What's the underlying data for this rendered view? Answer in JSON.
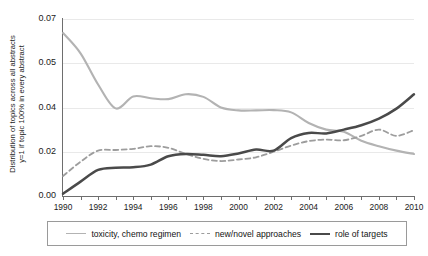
{
  "axis": {
    "y_title_line1": "Distribution of topics across all abstracts",
    "y_title_line2": "y=1 if topic 100% in every abstract",
    "y_tick_labels": [
      "0.07",
      "0.05",
      "0.04",
      "0.02",
      "0.00"
    ],
    "x_tick_labels": [
      "1990",
      "1992",
      "1994",
      "1996",
      "1998",
      "2000",
      "2002",
      "2004",
      "2006",
      "2008",
      "2010"
    ]
  },
  "legend": {
    "items": [
      {
        "label": "toxicity, chemo regimen",
        "style": "solid",
        "color": "#b3b3b3"
      },
      {
        "label": "new/novel approaches",
        "style": "dashed",
        "color": "#9d9d9d"
      },
      {
        "label": "role of targets",
        "style": "solid",
        "color": "#4a4a4a"
      }
    ]
  },
  "chart_data": {
    "type": "line",
    "title": "",
    "xlabel": "",
    "ylabel": "Distribution of topics across all abstracts y=1 if topic 100% in every abstract",
    "xlim": [
      1990,
      2010
    ],
    "ylim": [
      0.0,
      0.07
    ],
    "grid": true,
    "legend_position": "bottom",
    "yticks": [
      0.0,
      0.02,
      0.04,
      0.05,
      0.07
    ],
    "x": [
      1990,
      1991,
      1992,
      1993,
      1994,
      1995,
      1996,
      1997,
      1998,
      1999,
      2000,
      2001,
      2002,
      2003,
      2004,
      2005,
      2006,
      2007,
      2008,
      2009,
      2010
    ],
    "series": [
      {
        "name": "toxicity, chemo regimen",
        "style": "solid",
        "color": "#b3b3b3",
        "values": [
          0.0637,
          0.0545,
          0.0452,
          0.0396,
          0.0425,
          0.0421,
          0.0419,
          0.043,
          0.0424,
          0.04,
          0.0387,
          0.0387,
          0.0388,
          0.0378,
          0.033,
          0.03,
          0.029,
          0.025,
          0.0225,
          0.0205,
          0.019
        ],
        "note": "falls steeply 1990-1993, plateaus near 0.042 through 1998, then declines steadily to about 0.007 on the plotted axis"
      },
      {
        "name": "new/novel approaches",
        "style": "dashed",
        "color": "#9d9d9d",
        "values": [
          0.009,
          0.0155,
          0.0205,
          0.0208,
          0.0213,
          0.0225,
          0.0218,
          0.019,
          0.0168,
          0.0158,
          0.0165,
          0.0175,
          0.02,
          0.0228,
          0.0248,
          0.0255,
          0.0252,
          0.0272,
          0.03,
          0.0272,
          0.0298
        ],
        "note": "rises 1990-1995, dips near 1999, rises again to a local high near 2008, dips 2009, recovers by 2010"
      },
      {
        "name": "role of targets",
        "style": "solid",
        "color": "#4a4a4a",
        "values": [
          0.001,
          0.0065,
          0.0118,
          0.0128,
          0.013,
          0.0142,
          0.018,
          0.019,
          0.0186,
          0.018,
          0.0192,
          0.021,
          0.0205,
          0.0262,
          0.0285,
          0.0283,
          0.03,
          0.032,
          0.035,
          0.0395,
          0.043
        ],
        "note": "rises from near zero in 1990, flattens mid-1990s near 0.019, then climbs steadily to the highest value at 2010"
      }
    ]
  }
}
